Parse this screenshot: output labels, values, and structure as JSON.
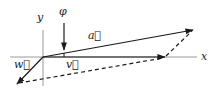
{
  "diagram": {
    "type": "vector-diagram",
    "axes": {
      "x_label": "x",
      "y_label": "y",
      "origin": [
        43,
        57
      ]
    },
    "angle_marker": {
      "label": "φ",
      "description": "small angle between vector a and x-axis"
    },
    "vectors": [
      {
        "name": "a",
        "label": "a⃗",
        "from": [
          43,
          57
        ],
        "to": [
          193,
          30
        ],
        "style": "solid"
      },
      {
        "name": "v",
        "label": "v⃗",
        "from": [
          43,
          57
        ],
        "to": [
          165,
          57
        ],
        "style": "solid"
      },
      {
        "name": "w",
        "label": "w⃗",
        "from": [
          43,
          57
        ],
        "to": [
          17,
          84
        ],
        "style": "solid"
      }
    ],
    "dashed_lines": [
      {
        "from": [
          17,
          84
        ],
        "to": [
          165,
          57
        ]
      },
      {
        "from": [
          165,
          57
        ],
        "to": [
          193,
          30
        ]
      }
    ],
    "colors": {
      "vector": "#1a1a1a",
      "axis": "#999999",
      "background": "#ffffff"
    }
  }
}
